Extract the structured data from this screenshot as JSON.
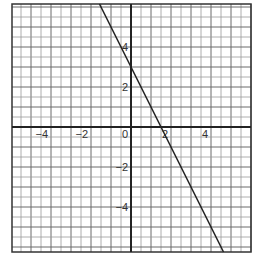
{
  "chart_data": {
    "type": "line",
    "title": "",
    "xlabel": "",
    "ylabel": "",
    "xlim": [
      -6,
      6
    ],
    "ylim": [
      -6.25,
      6.15
    ],
    "grid": true,
    "grid_minor_step": 0.5,
    "grid_major_step": 1,
    "equation": "y = -2x + 3",
    "series": [
      {
        "name": "line",
        "x": [
          -1.575,
          4.625
        ],
        "y": [
          6.15,
          -6.25
        ],
        "color": "#222222"
      }
    ],
    "key_points": {
      "y_intercept": [
        0,
        3
      ],
      "x_intercept": [
        1.5,
        0
      ]
    },
    "x_tick_labels": [
      {
        "value": -4,
        "label": "−4"
      },
      {
        "value": -2,
        "label": "−2"
      },
      {
        "value": 0,
        "label": "0"
      },
      {
        "value": 2,
        "label": "2"
      },
      {
        "value": 4,
        "label": "4"
      }
    ],
    "y_tick_labels": [
      {
        "value": 4,
        "label": "4"
      },
      {
        "value": 2,
        "label": "2"
      },
      {
        "value": -2,
        "label": "−2"
      },
      {
        "value": -4,
        "label": "−4"
      }
    ]
  },
  "style": {
    "minor_grid_color": "#9a9a9a",
    "major_grid_color": "#6a6a6a",
    "axis_color": "#222222",
    "line_color": "#222222",
    "frame_color": "#333333"
  }
}
